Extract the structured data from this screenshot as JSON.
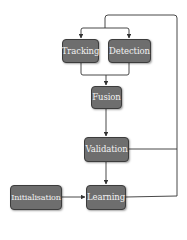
{
  "diagram": {
    "type": "flowchart",
    "nodes": {
      "tracking": {
        "label": "Tracking"
      },
      "detection": {
        "label": "Detection"
      },
      "fusion": {
        "label": "Fusion"
      },
      "validation": {
        "label": "Validation"
      },
      "learning": {
        "label": "Learning"
      },
      "initialisation": {
        "label": "Initialisation"
      }
    },
    "edges": [
      {
        "from": "learning",
        "to": "tracking",
        "note": "feedback loop via right side"
      },
      {
        "from": "learning",
        "to": "detection",
        "note": "feedback loop via right side"
      },
      {
        "from": "tracking",
        "to": "fusion"
      },
      {
        "from": "detection",
        "to": "fusion"
      },
      {
        "from": "fusion",
        "to": "validation"
      },
      {
        "from": "validation",
        "to": "learning"
      },
      {
        "from": "validation",
        "to": "feedback-loop",
        "note": "joins right side loop"
      },
      {
        "from": "initialisation",
        "to": "learning"
      }
    ],
    "colors": {
      "node_fill": "#6e6e6e",
      "node_border": "#3c3c3c",
      "node_text": "#f2f2f2",
      "edge": "#333333"
    }
  }
}
